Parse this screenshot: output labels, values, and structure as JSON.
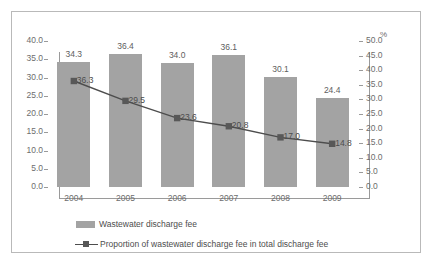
{
  "chart_data": {
    "type": "bar",
    "title": "",
    "subtitle": "",
    "xlabel": "",
    "ylabel": "",
    "categories": [
      "2004",
      "2005",
      "2006",
      "2007",
      "2008",
      "2009"
    ],
    "grid": false,
    "legend_position": "bottom",
    "axes": {
      "left": {
        "min": 0.0,
        "max": 40.0,
        "step": 5.0,
        "ticks": [
          "0.0",
          "5.0",
          "10.0",
          "15.0",
          "20.0",
          "25.0",
          "30.0",
          "35.0",
          "40.0"
        ],
        "unit_label": ""
      },
      "right": {
        "min": 0.0,
        "max": 50.0,
        "step": 5.0,
        "ticks": [
          "0.0",
          "5.0",
          "10.0",
          "15.0",
          "20.0",
          "25.0",
          "30.0",
          "35.0",
          "40.0",
          "45.0",
          "50.0"
        ],
        "unit_label": "%"
      }
    },
    "series": [
      {
        "name": "Wastewater discharge fee",
        "type": "bar",
        "axis": "left",
        "color": "#a3a3a3",
        "values": [
          34.3,
          36.4,
          34.0,
          36.1,
          30.1,
          24.4
        ],
        "labels": [
          "34.3",
          "36.4",
          "34.0",
          "36.1",
          "30.1",
          "24.4"
        ]
      },
      {
        "name": "Proportion of wastewater discharge fee in total discharge fee",
        "type": "line",
        "axis": "right",
        "color": "#4d4d4d",
        "marker": "square",
        "values": [
          36.3,
          29.5,
          23.6,
          20.8,
          17.0,
          14.8
        ],
        "labels": [
          "36.3",
          "29.5",
          "23.6",
          "20.8",
          "17.0",
          "14.8"
        ]
      }
    ]
  },
  "legend": {
    "items": [
      {
        "label": "Wastewater discharge fee",
        "marker": "bar-swatch-icon"
      },
      {
        "label": "Proportion of wastewater discharge fee in total discharge fee",
        "marker": "line-marker-icon"
      }
    ]
  }
}
